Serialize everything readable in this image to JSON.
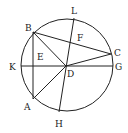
{
  "figure": {
    "type": "geometry-circle-diagram",
    "colors": {
      "stroke": "#222222",
      "background": "#ffffff",
      "text": "#222222"
    },
    "circle": {
      "cx": 67,
      "cy": 65,
      "r": 46
    },
    "points": {
      "A": {
        "x": 33,
        "y": 99
      },
      "B": {
        "x": 33,
        "y": 32
      },
      "C": {
        "x": 111,
        "y": 54
      },
      "D": {
        "x": 66,
        "y": 66
      },
      "E": {
        "x": 33,
        "y": 66
      },
      "F": {
        "x": 71,
        "y": 42
      },
      "G": {
        "x": 113,
        "y": 66
      },
      "H": {
        "x": 59,
        "y": 112
      },
      "K": {
        "x": 21,
        "y": 66
      },
      "L": {
        "x": 74,
        "y": 18
      }
    },
    "segments": [
      [
        "K",
        "G"
      ],
      [
        "B",
        "A"
      ],
      [
        "B",
        "C"
      ],
      [
        "B",
        "D"
      ],
      [
        "A",
        "D"
      ],
      [
        "D",
        "C"
      ],
      [
        "L",
        "H"
      ]
    ],
    "labels": {
      "A": {
        "text": "A",
        "x": 24,
        "y": 110
      },
      "B": {
        "text": "B",
        "x": 25,
        "y": 31
      },
      "C": {
        "text": "C",
        "x": 114,
        "y": 56
      },
      "D": {
        "text": "D",
        "x": 67,
        "y": 77
      },
      "E": {
        "text": "E",
        "x": 37,
        "y": 60
      },
      "F": {
        "text": "F",
        "x": 77,
        "y": 41
      },
      "G": {
        "text": "G",
        "x": 115,
        "y": 70
      },
      "H": {
        "text": "H",
        "x": 55,
        "y": 127
      },
      "K": {
        "text": "K",
        "x": 9,
        "y": 70
      },
      "L": {
        "text": "L",
        "x": 71,
        "y": 14
      }
    }
  }
}
